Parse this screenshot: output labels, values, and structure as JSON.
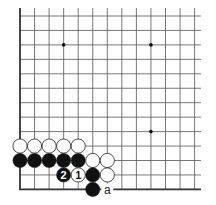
{
  "diagram": {
    "type": "go-board-corner",
    "grid": {
      "x0": 20,
      "dx": 14.55,
      "cols": 13,
      "y0": 16,
      "dy": 14.45,
      "rows": 13,
      "right_extent": 201,
      "line_color": "#555555",
      "edge_color": "#333333"
    },
    "star_points": [
      [
        3,
        2
      ],
      [
        9,
        2
      ],
      [
        9,
        8
      ]
    ],
    "stones": [
      {
        "col": 0,
        "row": 9,
        "color": "white"
      },
      {
        "col": 1,
        "row": 9,
        "color": "white"
      },
      {
        "col": 2,
        "row": 9,
        "color": "white"
      },
      {
        "col": 3,
        "row": 9,
        "color": "white"
      },
      {
        "col": 4,
        "row": 9,
        "color": "white"
      },
      {
        "col": 0,
        "row": 10,
        "color": "black"
      },
      {
        "col": 1,
        "row": 10,
        "color": "black"
      },
      {
        "col": 2,
        "row": 10,
        "color": "black"
      },
      {
        "col": 3,
        "row": 10,
        "color": "black"
      },
      {
        "col": 4,
        "row": 10,
        "color": "black"
      },
      {
        "col": 5,
        "row": 10,
        "color": "white"
      },
      {
        "col": 6,
        "row": 10,
        "color": "white"
      },
      {
        "col": 3,
        "row": 11,
        "color": "black",
        "label": "2"
      },
      {
        "col": 4,
        "row": 11,
        "color": "white",
        "label": "1"
      },
      {
        "col": 5,
        "row": 11,
        "color": "black"
      },
      {
        "col": 6,
        "row": 11,
        "color": "white"
      },
      {
        "col": 5,
        "row": 12,
        "color": "black"
      }
    ],
    "labels": [
      {
        "col": 6,
        "row": 12,
        "text": "a"
      }
    ]
  }
}
